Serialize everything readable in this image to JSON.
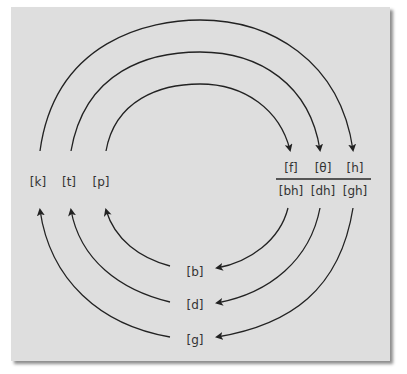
{
  "diagram": {
    "title": "",
    "voiceless_stops": [
      "[k]",
      "[t]",
      "[p]"
    ],
    "fricatives": [
      "[f]",
      "[θ]",
      "[h]"
    ],
    "aspirated_voiced": [
      "[bh]",
      "[dh]",
      "[gh]"
    ],
    "voiced_stops": [
      "[b]",
      "[d]",
      "[g]"
    ],
    "arrows": [
      {
        "from": "[p]",
        "to": "[f]"
      },
      {
        "from": "[t]",
        "to": "[θ]"
      },
      {
        "from": "[k]",
        "to": "[h]"
      },
      {
        "from": "[bh]",
        "to": "[b]"
      },
      {
        "from": "[dh]",
        "to": "[d]"
      },
      {
        "from": "[gh]",
        "to": "[g]"
      },
      {
        "from": "[b]",
        "to": "[p]"
      },
      {
        "from": "[d]",
        "to": "[t]"
      },
      {
        "from": "[g]",
        "to": "[k]"
      }
    ],
    "colors": {
      "background": "#dedede",
      "line": "#222222",
      "text": "#333333"
    }
  }
}
